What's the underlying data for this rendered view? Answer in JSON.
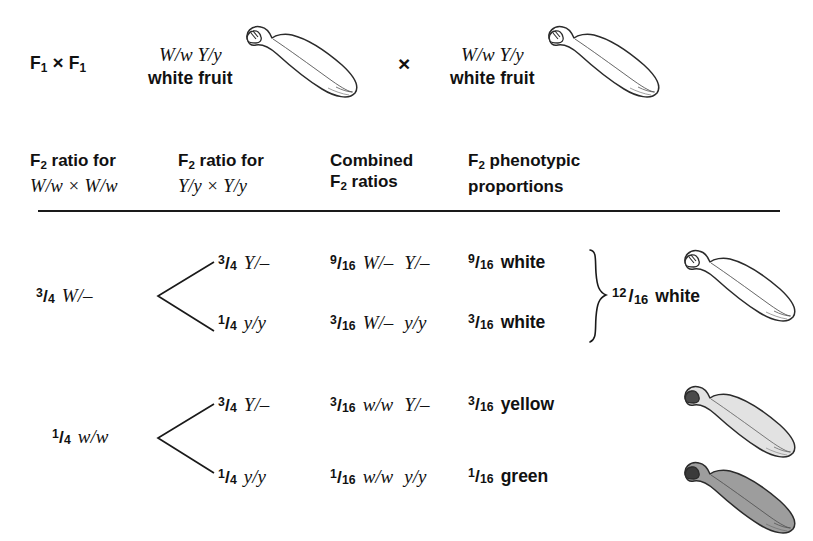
{
  "figure": {
    "type": "genetic-branch-diagram",
    "organism_fruit": "squash",
    "cross_row": {
      "generation_label_parts": {
        "f": "F",
        "sub": "1",
        "times": "×"
      },
      "generation_label": "F₁ × F₁",
      "parent_left": {
        "genotype": "W/w  Y/y",
        "phenotype": "white fruit",
        "fruit_color": "white"
      },
      "cross_symbol": "×",
      "parent_right": {
        "genotype": "W/w  Y/y",
        "phenotype": "white fruit",
        "fruit_color": "white"
      }
    },
    "columns": [
      {
        "line1": "F₂ ratio for",
        "line2": "W/w × W/w",
        "line2_style": "italic-serif"
      },
      {
        "line1": "F₂ ratio for",
        "line2": "Y/y × Y/y",
        "line2_style": "italic-serif"
      },
      {
        "line1": "Combined",
        "line2": "F₂ ratios",
        "line2_style": "sans"
      },
      {
        "line1": "F₂ phenotypic",
        "line2": "proportions",
        "line2_style": "sans"
      }
    ],
    "branches": [
      {
        "id": "branch-W",
        "parent": {
          "numerator": "3",
          "denominator": "4",
          "genotype": "W/–"
        },
        "children": [
          {
            "id": "row-1",
            "second_ratio": {
              "numerator": "3",
              "denominator": "4",
              "genotype": "Y/–"
            },
            "combined": {
              "numerator": "9",
              "denominator": "16",
              "genotype_a": "W/–",
              "genotype_b": "Y/–"
            },
            "phenotype": {
              "numerator": "9",
              "denominator": "16",
              "label": "white"
            }
          },
          {
            "id": "row-2",
            "second_ratio": {
              "numerator": "1",
              "denominator": "4",
              "genotype": "y/y"
            },
            "combined": {
              "numerator": "3",
              "denominator": "16",
              "genotype_a": "W/–",
              "genotype_b": "y/y"
            },
            "phenotype": {
              "numerator": "3",
              "denominator": "16",
              "label": "white"
            }
          }
        ],
        "brace_summary": {
          "numerator": "12",
          "denominator": "16",
          "label": "white",
          "fruit_color": "white"
        }
      },
      {
        "id": "branch-w",
        "parent": {
          "numerator": "1",
          "denominator": "4",
          "genotype": "w/w"
        },
        "children": [
          {
            "id": "row-3",
            "second_ratio": {
              "numerator": "3",
              "denominator": "4",
              "genotype": "Y/–"
            },
            "combined": {
              "numerator": "3",
              "denominator": "16",
              "genotype_a": "w/w",
              "genotype_b": "Y/–"
            },
            "phenotype": {
              "numerator": "3",
              "denominator": "16",
              "label": "yellow"
            },
            "fruit_color": "yellow"
          },
          {
            "id": "row-4",
            "second_ratio": {
              "numerator": "1",
              "denominator": "4",
              "genotype": "y/y"
            },
            "combined": {
              "numerator": "1",
              "denominator": "16",
              "genotype_a": "w/w",
              "genotype_b": "y/y"
            },
            "phenotype": {
              "numerator": "1",
              "denominator": "16",
              "label": "green"
            },
            "fruit_color": "green"
          }
        ]
      }
    ],
    "colors": {
      "ink": "#111111",
      "background": "#ffffff",
      "fruit_white_fill": "#ffffff",
      "fruit_yellow_fill": "#e2e2e2",
      "fruit_green_fill": "#9d9d9d",
      "rule": "#1a1a1a"
    }
  }
}
